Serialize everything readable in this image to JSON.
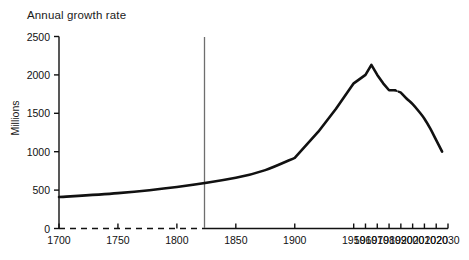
{
  "chart_data": {
    "type": "line",
    "title": "Annual growth rate",
    "xlabel": "",
    "ylabel": "Millions",
    "xlim": [
      1700,
      2030
    ],
    "ylim": [
      0,
      2500
    ],
    "grid": false,
    "legend": "none",
    "x_ticks": [
      "1700",
      "1750",
      "1800",
      "1850",
      "1900",
      "1950",
      "1960",
      "1970",
      "1980",
      "1990",
      "2000",
      "2010",
      "2020",
      "2030"
    ],
    "y_ticks": [
      "0",
      "500",
      "1000",
      "1500",
      "2000",
      "2500"
    ],
    "annotations": [
      {
        "name": "divider-1950",
        "x": 1950,
        "note": "vertical line separating historical estimates from projections"
      },
      {
        "name": "dotted-break",
        "x_from": 1985,
        "x_to": 1990,
        "note": "short dotted break in the curve"
      }
    ],
    "series": [
      {
        "name": "Annual growth rate",
        "color": "#111111",
        "x": [
          1700,
          1750,
          1800,
          1850,
          1875,
          1900,
          1920,
          1935,
          1950,
          1960,
          1965,
          1970,
          1975,
          1980,
          1985,
          1990,
          1995,
          2000,
          2005,
          2010,
          2015,
          2020,
          2025
        ],
        "values": [
          410,
          460,
          540,
          660,
          760,
          920,
          1260,
          1560,
          1890,
          2000,
          2130,
          2000,
          1890,
          1800,
          1800,
          1770,
          1690,
          1620,
          1530,
          1430,
          1300,
          1150,
          1000
        ]
      }
    ]
  },
  "axes": {
    "y_tick_values": [
      0,
      500,
      1000,
      1500,
      2000,
      2500
    ],
    "x_tick_values": [
      1700,
      1750,
      1800,
      1850,
      1900,
      1950,
      1960,
      1970,
      1980,
      1990,
      2000,
      2010,
      2020,
      2030
    ]
  },
  "colors": {
    "line": "#111111",
    "axis": "#111111",
    "divider": "#6e6e6e",
    "background": "#ffffff"
  }
}
